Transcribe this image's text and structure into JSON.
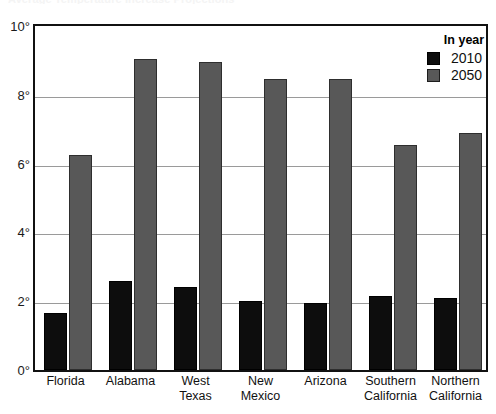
{
  "title": "Average Temperature Increase Projections",
  "legend": {
    "title": "In year",
    "entries": [
      {
        "label": "2010",
        "color": "#0d0d0d"
      },
      {
        "label": "2050",
        "color": "#585858"
      }
    ]
  },
  "axis": {
    "y_ticks": [
      "0°",
      "2°",
      "4°",
      "6°",
      "8°",
      "10°"
    ]
  },
  "chart_data": {
    "type": "bar",
    "title": "Average Temperature Increase Projections",
    "xlabel": "",
    "ylabel": "",
    "ylim": [
      0,
      10
    ],
    "yticks": [
      0,
      2,
      4,
      6,
      8,
      10
    ],
    "ytick_labels": [
      "0°",
      "2°",
      "4°",
      "6°",
      "8°",
      "10°"
    ],
    "grid": true,
    "legend_position": "top-right",
    "legend_title": "In year",
    "categories": [
      "Florida",
      "Alabama",
      "West Texas",
      "New Mexico",
      "Arizona",
      "Southern California",
      "Northern California"
    ],
    "category_lines": [
      [
        "Florida"
      ],
      [
        "Alabama"
      ],
      [
        "West",
        "Texas"
      ],
      [
        "New",
        "Mexico"
      ],
      [
        "Arizona"
      ],
      [
        "Southern",
        "California"
      ],
      [
        "Northern",
        "California"
      ]
    ],
    "series": [
      {
        "name": "2010",
        "color": "#0d0d0d",
        "values": [
          1.65,
          2.6,
          2.4,
          2.0,
          1.95,
          2.15,
          2.1
        ]
      },
      {
        "name": "2050",
        "color": "#585858",
        "values": [
          6.25,
          9.05,
          8.95,
          8.45,
          8.45,
          6.55,
          6.9
        ]
      }
    ]
  }
}
